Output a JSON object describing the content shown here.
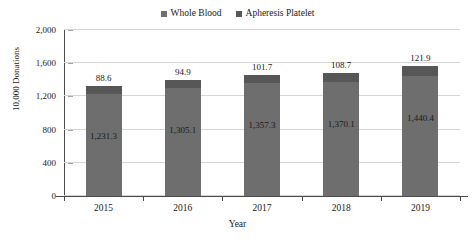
{
  "chart_data": {
    "type": "bar",
    "stacked": true,
    "title": "",
    "xlabel": "Year",
    "ylabel": "10,000 Donations",
    "categories": [
      "2015",
      "2016",
      "2017",
      "2018",
      "2019"
    ],
    "series": [
      {
        "name": "Whole Blood",
        "color": "#6e6e6e",
        "values": [
          1231.3,
          1305.1,
          1357.3,
          1370.1,
          1440.4
        ],
        "labels": [
          "1,231.3",
          "1,305.1",
          "1,357.3",
          "1,370.1",
          "1,440.4"
        ]
      },
      {
        "name": "Apheresis Platelet",
        "color": "#575757",
        "values": [
          88.6,
          94.9,
          101.7,
          108.7,
          121.9
        ],
        "labels": [
          "88.6",
          "94.9",
          "101.7",
          "108.7",
          "121.9"
        ]
      }
    ],
    "ylim": [
      0,
      2000
    ],
    "yticks": [
      0,
      400,
      800,
      1200,
      1600,
      2000
    ],
    "ytick_labels": [
      "0",
      "400",
      "800",
      "1,200",
      "1,600",
      "2,000"
    ],
    "grid": true,
    "legend_position": "top-center"
  },
  "legend": {
    "items": [
      {
        "label": "Whole Blood",
        "color": "#6e6e6e"
      },
      {
        "label": "Apheresis Platelet",
        "color": "#575757"
      }
    ]
  }
}
